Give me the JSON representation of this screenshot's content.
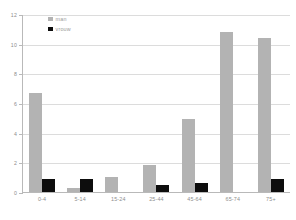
{
  "chart_data": {
    "type": "bar",
    "title": "",
    "subtitle": "",
    "xlabel": "",
    "ylabel": "",
    "categories": [
      "0-4",
      "5-14",
      "15-24",
      "25-44",
      "45-64",
      "65-74",
      "75+"
    ],
    "series": [
      {
        "name": "man",
        "color": "#b3b3b3",
        "values": [
          6.7,
          0.25,
          1.0,
          1.8,
          4.95,
          10.8,
          10.4
        ]
      },
      {
        "name": "vrouw",
        "color": "#0d0d0d",
        "values": [
          0.9,
          0.9,
          0.0,
          0.5,
          0.6,
          0.0,
          0.9
        ]
      }
    ],
    "ylim": [
      0,
      12
    ],
    "yticks": [
      0,
      2,
      4,
      6,
      8,
      10,
      12
    ],
    "ytick_labels": [
      "0",
      "2",
      "4",
      "6",
      "8",
      "10",
      "12"
    ],
    "grid": true,
    "grid_axis": "y",
    "legend_position": "top-left",
    "background": "#ffffff",
    "axis_color": "#b9b9b9",
    "grid_color": "#dcdcdc",
    "tick_label_color": "#8d8d8d"
  }
}
